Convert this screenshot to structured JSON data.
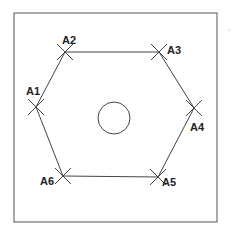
{
  "diagram": {
    "title": "",
    "points": [
      {
        "id": "A1",
        "label": "A1",
        "x": 36,
        "y": 107,
        "lx": 26,
        "ly": 86
      },
      {
        "id": "A2",
        "label": "A2",
        "x": 65,
        "y": 52,
        "lx": 62,
        "ly": 35
      },
      {
        "id": "A3",
        "label": "A3",
        "x": 159,
        "y": 52,
        "lx": 167,
        "ly": 45
      },
      {
        "id": "A4",
        "label": "A4",
        "x": 194,
        "y": 108,
        "lx": 190,
        "ly": 122
      },
      {
        "id": "A5",
        "label": "A5",
        "x": 158,
        "y": 177,
        "lx": 162,
        "ly": 177
      },
      {
        "id": "A6",
        "label": "A6",
        "x": 63,
        "y": 176,
        "lx": 40,
        "ly": 176
      }
    ],
    "center_circle": {
      "cx": 114,
      "cy": 118,
      "r": 16
    },
    "frame": {
      "x": 14,
      "y": 13,
      "w": 203,
      "h": 209
    },
    "colors": {
      "line": "#444444",
      "text": "#222222"
    }
  }
}
